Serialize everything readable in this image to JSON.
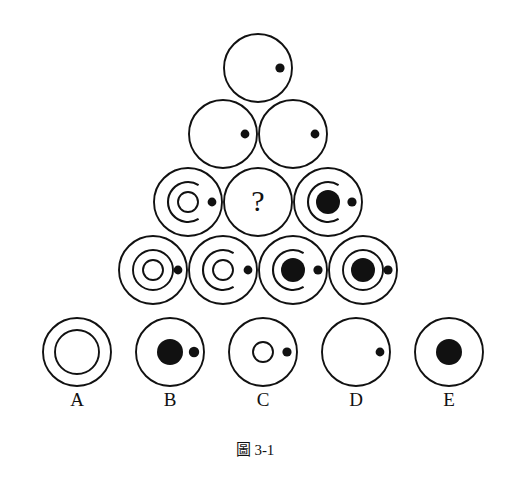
{
  "figure": {
    "caption": "圖 3-1",
    "question_mark": "?",
    "stroke_color": "#111111",
    "background_color": "#ffffff",
    "fill_color": "#111111"
  },
  "matrix": {
    "rows": [
      {
        "row_index": 1,
        "cells": [
          {
            "id": "r1c1",
            "cx": 258,
            "cy": 68,
            "r": 34,
            "ring": "none",
            "arc": "none",
            "nucleus": "none",
            "nucleus_r": 0,
            "satellite": true,
            "satellite_dx": 22,
            "satellite_r": 4.6,
            "is_question": false
          }
        ]
      },
      {
        "row_index": 2,
        "cells": [
          {
            "id": "r2c1",
            "cx": 223,
            "cy": 134,
            "r": 34,
            "ring": "none",
            "arc": "none",
            "nucleus": "none",
            "nucleus_r": 0,
            "satellite": true,
            "satellite_dx": 22,
            "satellite_r": 4.4,
            "is_question": false
          },
          {
            "id": "r2c2",
            "cx": 293,
            "cy": 134,
            "r": 34,
            "ring": "none",
            "arc": "none",
            "nucleus": "none",
            "nucleus_r": 0,
            "satellite": true,
            "satellite_dx": 22,
            "satellite_r": 4.4,
            "is_question": false
          }
        ]
      },
      {
        "row_index": 3,
        "cells": [
          {
            "id": "r3c1",
            "cx": 188,
            "cy": 202,
            "r": 34,
            "ring": "none",
            "arc": "open-right",
            "arc_r": 20,
            "nucleus": "open",
            "nucleus_r": 10,
            "satellite": true,
            "satellite_dx": 24,
            "satellite_r": 4.4,
            "is_question": false
          },
          {
            "id": "r3c2",
            "cx": 258,
            "cy": 202,
            "r": 34,
            "ring": "none",
            "arc": "none",
            "nucleus": "none",
            "nucleus_r": 0,
            "satellite": false,
            "satellite_dx": 0,
            "satellite_r": 0,
            "is_question": true
          },
          {
            "id": "r3c3",
            "cx": 328,
            "cy": 202,
            "r": 34,
            "ring": "none",
            "arc": "open-right",
            "arc_r": 20,
            "nucleus": "solid",
            "nucleus_r": 12,
            "satellite": true,
            "satellite_dx": 24,
            "satellite_r": 4.6,
            "is_question": false
          }
        ]
      },
      {
        "row_index": 4,
        "cells": [
          {
            "id": "r4c1",
            "cx": 153,
            "cy": 270,
            "r": 34,
            "ring": "full",
            "ring_r": 20,
            "arc": "none",
            "nucleus": "open",
            "nucleus_r": 10,
            "satellite": true,
            "satellite_dx": 25,
            "satellite_r": 4.4,
            "is_question": false
          },
          {
            "id": "r4c2",
            "cx": 223,
            "cy": 270,
            "r": 34,
            "ring": "none",
            "arc": "open-right",
            "arc_r": 20,
            "nucleus": "open",
            "nucleus_r": 10,
            "satellite": true,
            "satellite_dx": 25,
            "satellite_r": 4.4,
            "is_question": false
          },
          {
            "id": "r4c3",
            "cx": 293,
            "cy": 270,
            "r": 34,
            "ring": "none",
            "arc": "open-right",
            "arc_r": 20,
            "nucleus": "solid",
            "nucleus_r": 12,
            "satellite": true,
            "satellite_dx": 25,
            "satellite_r": 4.6,
            "is_question": false
          },
          {
            "id": "r4c4",
            "cx": 363,
            "cy": 270,
            "r": 34,
            "ring": "full",
            "ring_r": 20,
            "arc": "none",
            "nucleus": "solid",
            "nucleus_r": 12,
            "satellite": true,
            "satellite_dx": 25,
            "satellite_r": 4.6,
            "is_question": false
          }
        ]
      }
    ]
  },
  "options": [
    {
      "label": "A",
      "cx": 77,
      "cy": 352,
      "r": 34,
      "ring": "full",
      "ring_r": 22,
      "arc": "none",
      "nucleus": "none",
      "nucleus_r": 0,
      "satellite": false,
      "satellite_dx": 0,
      "satellite_r": 0
    },
    {
      "label": "B",
      "cx": 170,
      "cy": 352,
      "r": 34,
      "ring": "none",
      "arc": "none",
      "nucleus": "solid",
      "nucleus_r": 13,
      "satellite": true,
      "satellite_dx": 24,
      "satellite_r": 5.2
    },
    {
      "label": "C",
      "cx": 263,
      "cy": 352,
      "r": 34,
      "ring": "none",
      "arc": "none",
      "nucleus": "open",
      "nucleus_r": 10,
      "satellite": true,
      "satellite_dx": 24,
      "satellite_r": 4.6
    },
    {
      "label": "D",
      "cx": 356,
      "cy": 352,
      "r": 34,
      "ring": "none",
      "arc": "none",
      "nucleus": "none",
      "nucleus_r": 0,
      "satellite": true,
      "satellite_dx": 24,
      "satellite_r": 4.4
    },
    {
      "label": "E",
      "cx": 449,
      "cy": 352,
      "r": 34,
      "ring": "none",
      "arc": "none",
      "nucleus": "solid",
      "nucleus_r": 13,
      "satellite": false,
      "satellite_dx": 0,
      "satellite_r": 0
    }
  ],
  "option_label_y": 406,
  "caption_position": {
    "x": 255,
    "y": 455
  }
}
